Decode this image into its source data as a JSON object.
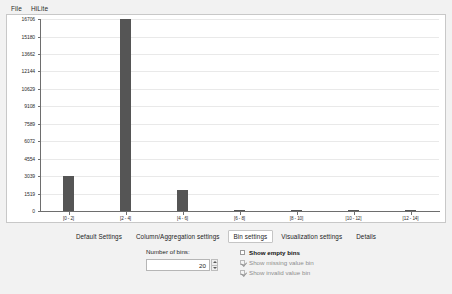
{
  "menubar": {
    "items": [
      {
        "label": "File"
      },
      {
        "label": "HiLite"
      }
    ]
  },
  "chart_data": {
    "type": "bar",
    "title": "",
    "xlabel": "",
    "ylabel": "",
    "categories": [
      "[0 - 2]",
      "[2 - 4]",
      "[4 - 6]",
      "[6 - 8]",
      "[8 - 10]",
      "[10 - 12]",
      "[12 - 14]"
    ],
    "values": [
      3039,
      16706,
      1800,
      120,
      90,
      95,
      85
    ],
    "ylim": [
      0,
      16706
    ],
    "ytick_labels": [
      "16706",
      "15180",
      "13662",
      "12144",
      "10629",
      "9108",
      "7589",
      "6072",
      "4554",
      "3039",
      "1519",
      "0"
    ],
    "ytick_values": [
      16706,
      15180,
      13662,
      12144,
      10629,
      9108,
      7589,
      6072,
      4554,
      3039,
      1519,
      0
    ],
    "grid": true,
    "legend": "none",
    "bar_color": "#555555",
    "axis_color": "#6e6e6e",
    "grid_color": "#e9e9e9",
    "plot_background": "#ffffff"
  },
  "tabs": [
    {
      "label": "Default Settings",
      "selected": false
    },
    {
      "label": "Column/Aggregation settings",
      "selected": false
    },
    {
      "label": "Bin settings",
      "selected": true
    },
    {
      "label": "Visualization settings",
      "selected": false
    },
    {
      "label": "Details",
      "selected": false
    }
  ],
  "bin_settings": {
    "number_of_bins_label": "Number of bins:",
    "number_of_bins_value": "20",
    "checkboxes": [
      {
        "label": "Show empty bins",
        "checked": false,
        "disabled": false
      },
      {
        "label": "Show missing value bin",
        "checked": true,
        "disabled": true
      },
      {
        "label": "Show invalid value bin",
        "checked": true,
        "disabled": true
      }
    ]
  }
}
